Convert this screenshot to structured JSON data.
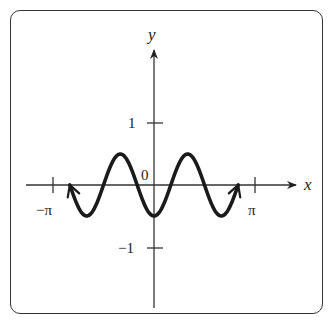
{
  "chart_data": {
    "type": "line",
    "title": "",
    "function": "y = -0.5 cos(3x)",
    "xlabel": "x",
    "ylabel": "y",
    "x_tick_labels": [
      "−π",
      "π"
    ],
    "y_tick_labels": [
      "1",
      "−1"
    ],
    "origin_label": "0",
    "xlim": [
      -3.1416,
      3.1416
    ],
    "ylim": [
      -1,
      1
    ],
    "domain": [
      -2.618,
      2.618
    ],
    "grid": false,
    "legend": null,
    "series": [
      {
        "name": "curve",
        "x": [
          -2.618,
          -2.094,
          -1.571,
          -1.047,
          -0.524,
          0,
          0.524,
          1.047,
          1.571,
          2.094,
          2.618
        ],
        "y": [
          0,
          -0.5,
          0,
          0.5,
          0,
          -0.5,
          0,
          0.5,
          0,
          -0.5,
          0
        ]
      }
    ],
    "endpoints": "arrows at both ends"
  }
}
